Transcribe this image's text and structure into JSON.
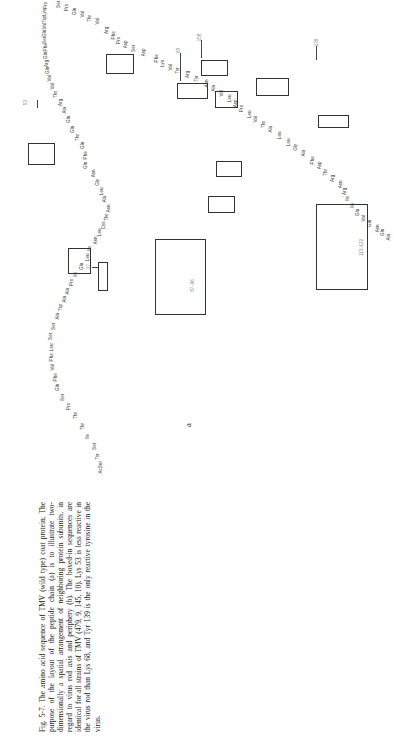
{
  "caption": {
    "fig_label": "Fig. 5-7.",
    "text": "Fig. 5-7. The amino acid sequence of TMV (wild type) coat protein. The purpose of the layout of the peptide chain (a) is to illustrate two-dimensionally a spatial arrangement of neighboring protein subunits, in regard to virus rod axis and periphery (b). The boxed-in sequences are identical for all strains of TMV (479, 9, 145, 10). Lys 53 is less reactive in the virus rod than Lys 68, and Tyr 139 is the only reactive tyrosine in the virus."
  },
  "panel_label": "a",
  "markers": {
    "m27": "27",
    "m53": "53",
    "m68": "68",
    "m139": "139",
    "m158": "158"
  },
  "box_labels": {
    "b87": "87–96",
    "b113": "113–122"
  },
  "residues": [
    {
      "id": "r1",
      "t": "AcSer",
      "x": 95,
      "y": 465
    },
    {
      "id": "r2",
      "t": "Tyr",
      "x": 95,
      "y": 454
    },
    {
      "id": "r3",
      "t": "Ser",
      "x": 92,
      "y": 444
    },
    {
      "id": "r4",
      "t": "Ile",
      "x": 86,
      "y": 434
    },
    {
      "id": "r5",
      "t": "Thr",
      "x": 80,
      "y": 424
    },
    {
      "id": "r6",
      "t": "Thr",
      "x": 73,
      "y": 413
    },
    {
      "id": "r7",
      "t": "Pro",
      "x": 66,
      "y": 404
    },
    {
      "id": "r8",
      "t": "Ser",
      "x": 60,
      "y": 395
    },
    {
      "id": "r9",
      "t": "Gln",
      "x": 55,
      "y": 385
    },
    {
      "id": "r10",
      "t": "Phe",
      "x": 52,
      "y": 375
    },
    {
      "id": "r11",
      "t": "Val",
      "x": 50,
      "y": 365
    },
    {
      "id": "r12",
      "t": "Phe",
      "x": 48,
      "y": 355
    },
    {
      "id": "r13",
      "t": "Leu",
      "x": 48,
      "y": 345
    },
    {
      "id": "r14",
      "t": "Ser",
      "x": 48,
      "y": 334
    },
    {
      "id": "r15",
      "t": "Ser",
      "x": 51,
      "y": 324
    },
    {
      "id": "r16",
      "t": "Ala",
      "x": 55,
      "y": 314
    },
    {
      "id": "r17",
      "t": "Trp",
      "x": 58,
      "y": 305
    },
    {
      "id": "r18",
      "t": "Ala",
      "x": 62,
      "y": 297
    },
    {
      "id": "r19",
      "t": "Ala",
      "x": 65,
      "y": 289
    },
    {
      "id": "r20",
      "t": "Pro",
      "x": 69,
      "y": 280
    },
    {
      "id": "r21",
      "t": "Ile",
      "x": 74,
      "y": 272
    },
    {
      "id": "r22",
      "t": "Glu",
      "x": 79,
      "y": 264
    },
    {
      "id": "r23",
      "t": "Leu",
      "x": 84,
      "y": 255
    },
    {
      "id": "r24",
      "t": "Ile",
      "x": 88,
      "y": 246
    },
    {
      "id": "r25",
      "t": "Asn",
      "x": 92,
      "y": 238
    },
    {
      "id": "r26",
      "t": "Leu",
      "x": 96,
      "y": 230
    },
    {
      "id": "r27",
      "t": "Cys",
      "x": 100,
      "y": 223
    },
    {
      "id": "r28",
      "t": "Thr",
      "x": 104,
      "y": 215
    },
    {
      "id": "r29",
      "t": "Asn",
      "x": 105,
      "y": 206
    },
    {
      "id": "r30",
      "t": "Ala",
      "x": 102,
      "y": 197
    },
    {
      "id": "r31",
      "t": "Leu",
      "x": 98,
      "y": 189
    },
    {
      "id": "r32",
      "t": "Gly",
      "x": 95,
      "y": 180
    },
    {
      "id": "r33",
      "t": "Asn",
      "x": 90,
      "y": 171
    },
    {
      "id": "r34",
      "t": "Gln",
      "x": 83,
      "y": 163
    },
    {
      "id": "r35",
      "t": "Phe",
      "x": 82,
      "y": 153
    },
    {
      "id": "r36",
      "t": "Gln",
      "x": 80,
      "y": 143
    },
    {
      "id": "r37",
      "t": "Thr",
      "x": 75,
      "y": 135
    },
    {
      "id": "r38",
      "t": "Gln",
      "x": 70,
      "y": 127
    },
    {
      "id": "r39",
      "t": "Gln",
      "x": 66,
      "y": 117
    },
    {
      "id": "r40",
      "t": "Ala",
      "x": 62,
      "y": 108
    },
    {
      "id": "r41",
      "t": "Arg",
      "x": 58,
      "y": 100
    },
    {
      "id": "r42",
      "t": "Thr",
      "x": 53,
      "y": 92
    },
    {
      "id": "r43",
      "t": "Val",
      "x": 50,
      "y": 84
    },
    {
      "id": "r44",
      "t": "Val",
      "x": 47,
      "y": 76
    },
    {
      "id": "r45",
      "t": "Gln",
      "x": 45,
      "y": 68
    },
    {
      "id": "r46",
      "t": "Arg",
      "x": 44,
      "y": 61
    },
    {
      "id": "r47",
      "t": "Gln",
      "x": 43,
      "y": 53
    },
    {
      "id": "r48",
      "t": "Phe",
      "x": 42,
      "y": 45
    },
    {
      "id": "r49",
      "t": "Ser",
      "x": 42,
      "y": 38
    },
    {
      "id": "r50",
      "t": "Gln",
      "x": 42,
      "y": 31
    },
    {
      "id": "r51",
      "t": "Val",
      "x": 42,
      "y": 24
    },
    {
      "id": "r52",
      "t": "Trp",
      "x": 42,
      "y": 17
    },
    {
      "id": "r53",
      "t": "Lys",
      "x": 42,
      "y": 10
    },
    {
      "id": "r54",
      "t": "Pro",
      "x": 43,
      "y": 3
    },
    {
      "id": "r55",
      "t": "Ser",
      "x": 56,
      "y": 2
    },
    {
      "id": "r56",
      "t": "Pro",
      "x": 64,
      "y": 5
    },
    {
      "id": "r57",
      "t": "Gln",
      "x": 72,
      "y": 9
    },
    {
      "id": "r58",
      "t": "Val",
      "x": 80,
      "y": 12
    },
    {
      "id": "r59",
      "t": "Thr",
      "x": 87,
      "y": 16
    },
    {
      "id": "r60",
      "t": "Val",
      "x": 95,
      "y": 19
    },
    {
      "id": "r61",
      "t": "Arg",
      "x": 104,
      "y": 28
    },
    {
      "id": "r62",
      "t": "Phe",
      "x": 110,
      "y": 33
    },
    {
      "id": "r63",
      "t": "Pro",
      "x": 116,
      "y": 38
    },
    {
      "id": "r64",
      "t": "Asp",
      "x": 122,
      "y": 42
    },
    {
      "id": "r65",
      "t": "Ser",
      "x": 131,
      "y": 46
    },
    {
      "id": "r66",
      "t": "Asp",
      "x": 140,
      "y": 50
    },
    {
      "id": "r67",
      "t": "Phe",
      "x": 153,
      "y": 56
    },
    {
      "id": "r68",
      "t": "Lys",
      "x": 160,
      "y": 61
    },
    {
      "id": "r69",
      "t": "Val",
      "x": 168,
      "y": 65
    },
    {
      "id": "r70",
      "t": "Tyr",
      "x": 175,
      "y": 68
    },
    {
      "id": "r71",
      "t": "Arg",
      "x": 185,
      "y": 72
    },
    {
      "id": "r72",
      "t": "Tyr",
      "x": 194,
      "y": 76
    },
    {
      "id": "r73",
      "t": "Asn",
      "x": 203,
      "y": 81
    },
    {
      "id": "r74",
      "t": "Ala",
      "x": 211,
      "y": 86
    },
    {
      "id": "r75",
      "t": "Val",
      "x": 219,
      "y": 91
    },
    {
      "id": "r76",
      "t": "Leu",
      "x": 226,
      "y": 96
    },
    {
      "id": "r77",
      "t": "Asp",
      "x": 232,
      "y": 101
    },
    {
      "id": "r78",
      "t": "Pro",
      "x": 239,
      "y": 106
    },
    {
      "id": "r79",
      "t": "Leu",
      "x": 246,
      "y": 112
    },
    {
      "id": "r80",
      "t": "Val",
      "x": 253,
      "y": 117
    },
    {
      "id": "r81",
      "t": "Thr",
      "x": 261,
      "y": 122
    },
    {
      "id": "r82",
      "t": "Ala",
      "x": 268,
      "y": 127
    },
    {
      "id": "r83",
      "t": "Leu",
      "x": 276,
      "y": 133
    },
    {
      "id": "r84",
      "t": "Leu",
      "x": 285,
      "y": 140
    },
    {
      "id": "r85",
      "t": "Gly",
      "x": 293,
      "y": 145
    },
    {
      "id": "r86",
      "t": "Ala",
      "x": 301,
      "y": 151
    },
    {
      "id": "r87",
      "t": "Phe",
      "x": 309,
      "y": 158
    },
    {
      "id": "r88",
      "t": "Asp",
      "x": 316,
      "y": 163
    },
    {
      "id": "r89",
      "t": "Thr",
      "x": 323,
      "y": 170
    },
    {
      "id": "r90",
      "t": "Arg",
      "x": 330,
      "y": 176
    },
    {
      "id": "r91",
      "t": "Asn",
      "x": 337,
      "y": 182
    },
    {
      "id": "r92",
      "t": "Arg",
      "x": 342,
      "y": 189
    },
    {
      "id": "r93",
      "t": "Ile",
      "x": 346,
      "y": 196
    },
    {
      "id": "r94",
      "t": "Ile",
      "x": 351,
      "y": 203
    },
    {
      "id": "r95",
      "t": "Glu",
      "x": 355,
      "y": 210
    },
    {
      "id": "r96",
      "t": "Val",
      "x": 361,
      "y": 216
    },
    {
      "id": "r97",
      "t": "Glu",
      "x": 367,
      "y": 221
    },
    {
      "id": "r98",
      "t": "Asn",
      "x": 374,
      "y": 226
    },
    {
      "id": "r99",
      "t": "Gln",
      "x": 380,
      "y": 230
    },
    {
      "id": "r100",
      "t": "Ala",
      "x": 386,
      "y": 235
    }
  ]
}
